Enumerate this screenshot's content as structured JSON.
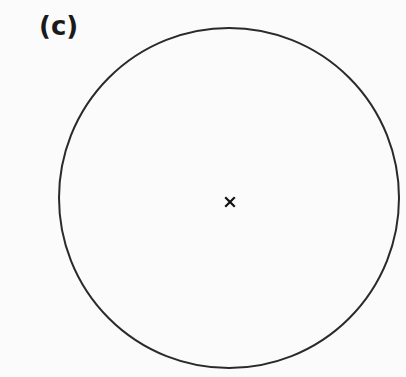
{
  "figure": {
    "panel_label": "(c)",
    "circle": {
      "cx": 229,
      "cy": 198,
      "r": 170,
      "stroke": "#2a2a2a",
      "stroke_width": 2
    },
    "center_marker": {
      "symbol": "×",
      "x": 230,
      "y": 202,
      "color": "#111111"
    }
  }
}
